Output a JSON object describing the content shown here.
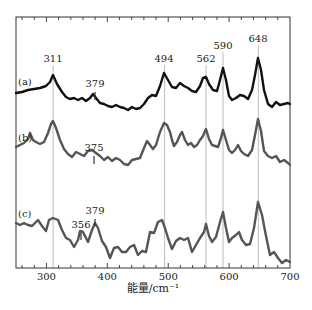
{
  "chart_data": {
    "type": "line",
    "title": "",
    "xlabel": "能量/cm⁻¹",
    "ylabel": "",
    "xlim": [
      250,
      700
    ],
    "x_ticks": [
      300,
      400,
      500,
      600,
      700
    ],
    "grid": false,
    "reference_lines": [
      311,
      494,
      562,
      590,
      648
    ],
    "series": [
      {
        "name": "(a)",
        "color": "#111111",
        "peak_labels": [
          {
            "x": 311,
            "text": "311"
          },
          {
            "x": 379,
            "text": "379"
          },
          {
            "x": 494,
            "text": "494"
          },
          {
            "x": 562,
            "text": "562"
          },
          {
            "x": 590,
            "text": "590"
          },
          {
            "x": 648,
            "text": "648"
          }
        ],
        "points_px": [
          [
            16,
            93
          ],
          [
            22,
            92
          ],
          [
            28,
            90
          ],
          [
            34,
            89
          ],
          [
            40,
            88
          ],
          [
            46,
            86
          ],
          [
            50,
            82
          ],
          [
            53,
            75
          ],
          [
            57,
            84
          ],
          [
            62,
            92
          ],
          [
            66,
            97
          ],
          [
            70,
            99
          ],
          [
            74,
            98
          ],
          [
            78,
            100
          ],
          [
            82,
            98
          ],
          [
            86,
            101
          ],
          [
            90,
            98
          ],
          [
            93,
            94
          ],
          [
            96,
            98
          ],
          [
            100,
            103
          ],
          [
            104,
            104
          ],
          [
            108,
            106
          ],
          [
            112,
            107
          ],
          [
            116,
            105
          ],
          [
            120,
            107
          ],
          [
            124,
            108
          ],
          [
            128,
            110
          ],
          [
            132,
            107
          ],
          [
            136,
            109
          ],
          [
            140,
            108
          ],
          [
            144,
            104
          ],
          [
            148,
            98
          ],
          [
            152,
            95
          ],
          [
            156,
            96
          ],
          [
            160,
            86
          ],
          [
            164,
            73
          ],
          [
            168,
            80
          ],
          [
            172,
            87
          ],
          [
            176,
            88
          ],
          [
            180,
            83
          ],
          [
            184,
            86
          ],
          [
            188,
            88
          ],
          [
            192,
            91
          ],
          [
            196,
            92
          ],
          [
            200,
            86
          ],
          [
            203,
            78
          ],
          [
            206,
            77
          ],
          [
            209,
            84
          ],
          [
            213,
            90
          ],
          [
            217,
            91
          ],
          [
            220,
            80
          ],
          [
            223,
            68
          ],
          [
            226,
            80
          ],
          [
            229,
            96
          ],
          [
            232,
            100
          ],
          [
            236,
            98
          ],
          [
            240,
            95
          ],
          [
            244,
            96
          ],
          [
            248,
            99
          ],
          [
            252,
            90
          ],
          [
            255,
            75
          ],
          [
            258,
            58
          ],
          [
            261,
            70
          ],
          [
            264,
            90
          ],
          [
            268,
            104
          ],
          [
            272,
            107
          ],
          [
            276,
            102
          ],
          [
            280,
            105
          ],
          [
            284,
            104
          ],
          [
            288,
            103
          ],
          [
            290,
            104
          ]
        ]
      },
      {
        "name": "(b)",
        "color": "#555555",
        "peak_labels": [
          {
            "x": 375,
            "text": "375"
          }
        ],
        "points_px": [
          [
            16,
            147
          ],
          [
            20,
            145
          ],
          [
            24,
            143
          ],
          [
            28,
            139
          ],
          [
            30,
            133
          ],
          [
            33,
            140
          ],
          [
            36,
            142
          ],
          [
            40,
            144
          ],
          [
            44,
            142
          ],
          [
            48,
            133
          ],
          [
            51,
            124
          ],
          [
            53,
            121
          ],
          [
            56,
            128
          ],
          [
            60,
            140
          ],
          [
            64,
            149
          ],
          [
            68,
            154
          ],
          [
            72,
            157
          ],
          [
            76,
            152
          ],
          [
            80,
            154
          ],
          [
            84,
            156
          ],
          [
            88,
            151
          ],
          [
            92,
            150
          ],
          [
            96,
            153
          ],
          [
            100,
            156
          ],
          [
            104,
            160
          ],
          [
            108,
            157
          ],
          [
            112,
            161
          ],
          [
            116,
            158
          ],
          [
            120,
            160
          ],
          [
            124,
            164
          ],
          [
            128,
            165
          ],
          [
            132,
            160
          ],
          [
            136,
            159
          ],
          [
            140,
            158
          ],
          [
            144,
            148
          ],
          [
            147,
            141
          ],
          [
            150,
            145
          ],
          [
            153,
            149
          ],
          [
            156,
            145
          ],
          [
            160,
            132
          ],
          [
            164,
            123
          ],
          [
            167,
            125
          ],
          [
            170,
            132
          ],
          [
            172,
            140
          ],
          [
            174,
            146
          ],
          [
            177,
            142
          ],
          [
            180,
            135
          ],
          [
            182,
            132
          ],
          [
            185,
            140
          ],
          [
            188,
            145
          ],
          [
            191,
            143
          ],
          [
            194,
            147
          ],
          [
            197,
            145
          ],
          [
            200,
            140
          ],
          [
            203,
            136
          ],
          [
            206,
            129
          ],
          [
            209,
            139
          ],
          [
            212,
            145
          ],
          [
            215,
            146
          ],
          [
            218,
            147
          ],
          [
            221,
            138
          ],
          [
            223,
            130
          ],
          [
            226,
            140
          ],
          [
            229,
            150
          ],
          [
            232,
            153
          ],
          [
            235,
            150
          ],
          [
            238,
            145
          ],
          [
            241,
            151
          ],
          [
            244,
            154
          ],
          [
            248,
            156
          ],
          [
            252,
            150
          ],
          [
            255,
            135
          ],
          [
            258,
            119
          ],
          [
            261,
            131
          ],
          [
            264,
            151
          ],
          [
            268,
            156
          ],
          [
            272,
            158
          ],
          [
            276,
            156
          ],
          [
            280,
            162
          ],
          [
            284,
            160
          ],
          [
            288,
            163
          ],
          [
            290,
            165
          ]
        ]
      },
      {
        "name": "(c)",
        "color": "#555555",
        "peak_labels": [
          {
            "x": 356,
            "text": "356"
          },
          {
            "x": 379,
            "text": "379"
          }
        ],
        "points_px": [
          [
            16,
            223
          ],
          [
            20,
            225
          ],
          [
            24,
            223
          ],
          [
            28,
            225
          ],
          [
            32,
            226
          ],
          [
            36,
            222
          ],
          [
            38,
            220
          ],
          [
            42,
            226
          ],
          [
            46,
            231
          ],
          [
            49,
            220
          ],
          [
            53,
            218
          ],
          [
            58,
            220
          ],
          [
            62,
            230
          ],
          [
            66,
            238
          ],
          [
            70,
            240
          ],
          [
            74,
            247
          ],
          [
            78,
            240
          ],
          [
            80,
            231
          ],
          [
            83,
            232
          ],
          [
            86,
            238
          ],
          [
            88,
            242
          ],
          [
            92,
            230
          ],
          [
            95,
            223
          ],
          [
            98,
            228
          ],
          [
            102,
            241
          ],
          [
            106,
            247
          ],
          [
            110,
            258
          ],
          [
            114,
            248
          ],
          [
            118,
            247
          ],
          [
            122,
            252
          ],
          [
            126,
            252
          ],
          [
            130,
            247
          ],
          [
            134,
            245
          ],
          [
            138,
            255
          ],
          [
            142,
            251
          ],
          [
            146,
            252
          ],
          [
            150,
            232
          ],
          [
            154,
            233
          ],
          [
            158,
            222
          ],
          [
            162,
            220
          ],
          [
            165,
            228
          ],
          [
            168,
            238
          ],
          [
            172,
            249
          ],
          [
            176,
            241
          ],
          [
            180,
            238
          ],
          [
            184,
            240
          ],
          [
            188,
            238
          ],
          [
            192,
            252
          ],
          [
            196,
            245
          ],
          [
            200,
            238
          ],
          [
            204,
            232
          ],
          [
            206,
            224
          ],
          [
            209,
            236
          ],
          [
            212,
            242
          ],
          [
            216,
            237
          ],
          [
            220,
            222
          ],
          [
            223,
            212
          ],
          [
            226,
            228
          ],
          [
            229,
            242
          ],
          [
            232,
            238
          ],
          [
            236,
            235
          ],
          [
            239,
            232
          ],
          [
            242,
            240
          ],
          [
            246,
            245
          ],
          [
            250,
            244
          ],
          [
            254,
            228
          ],
          [
            258,
            202
          ],
          [
            262,
            215
          ],
          [
            266,
            236
          ],
          [
            270,
            255
          ],
          [
            274,
            252
          ],
          [
            278,
            258
          ],
          [
            282,
            263
          ],
          [
            286,
            260
          ],
          [
            290,
            262
          ]
        ]
      }
    ]
  },
  "labels": {
    "a": "(a)",
    "b": "(b)",
    "c": "(c)",
    "x_axis": "能量/cm⁻¹"
  }
}
